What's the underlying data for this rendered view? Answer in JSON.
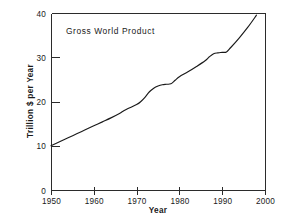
{
  "chart_data": {
    "type": "line",
    "title": "Gross World Product",
    "xlabel": "Year",
    "ylabel": "Trillion $ per Year",
    "xlim": [
      1950,
      2000
    ],
    "ylim": [
      0,
      40
    ],
    "grid": false,
    "legend": "none",
    "xticks": [
      1950,
      1960,
      1970,
      1980,
      1990,
      2000
    ],
    "xtick_labels": [
      "1950",
      "1960",
      "1970",
      "1980",
      "1990",
      "2000"
    ],
    "yticks": [
      0,
      10,
      20,
      30,
      40
    ],
    "ytick_labels": [
      "0",
      "10",
      "20",
      "30",
      "40"
    ],
    "series": [
      {
        "name": "Gross World Product",
        "x": [
          1950,
          1952,
          1954,
          1956,
          1958,
          1960,
          1962,
          1964,
          1966,
          1967,
          1968,
          1970,
          1971,
          1972,
          1973,
          1974,
          1975,
          1976,
          1977,
          1978,
          1979,
          1980,
          1982,
          1984,
          1986,
          1987,
          1988,
          1989,
          1990,
          1991,
          1992,
          1994,
          1996,
          1998
        ],
        "y": [
          10.0,
          10.9,
          11.8,
          12.7,
          13.6,
          14.5,
          15.4,
          16.3,
          17.3,
          17.9,
          18.4,
          19.3,
          20.0,
          21.0,
          22.2,
          23.0,
          23.5,
          23.8,
          23.9,
          24.0,
          24.8,
          25.6,
          26.7,
          27.9,
          29.2,
          30.1,
          30.8,
          31.0,
          31.1,
          31.2,
          32.2,
          34.4,
          36.8,
          39.5
        ]
      }
    ]
  },
  "axes_geometry": {
    "plot_left": 51,
    "plot_right": 265,
    "plot_top": 13,
    "plot_bottom": 190
  }
}
